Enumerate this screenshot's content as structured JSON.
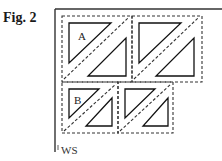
{
  "figure": {
    "label": "Fig. 2",
    "blocks": [
      {
        "id": "block-a",
        "label": "A"
      },
      {
        "id": "block-2",
        "label": ""
      },
      {
        "id": "block-b",
        "label": "B"
      },
      {
        "id": "block-4",
        "label": ""
      }
    ],
    "edge_label": "WS"
  }
}
